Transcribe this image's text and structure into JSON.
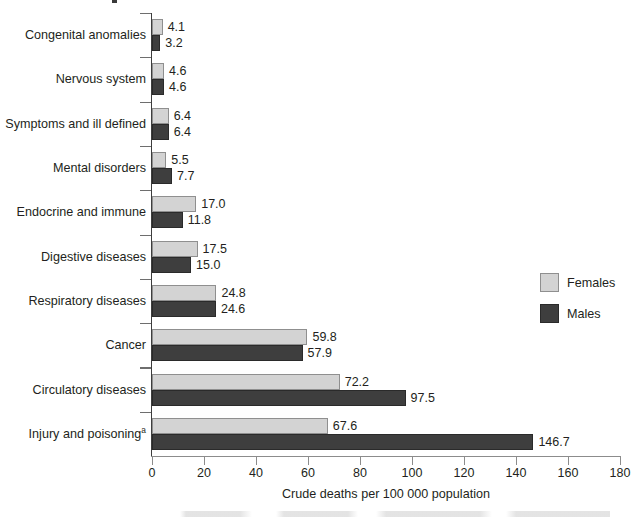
{
  "chart_data": {
    "type": "bar",
    "orientation": "horizontal",
    "title": "",
    "xlabel": "Crude deaths per 100 000 population",
    "ylabel": "",
    "xlim": [
      0,
      180
    ],
    "xticks": [
      0,
      20,
      40,
      60,
      80,
      100,
      120,
      140,
      160,
      180
    ],
    "grid": false,
    "legend_position": "right-middle",
    "categories": [
      "Congenital anomalies",
      "Nervous system",
      "Symptoms and ill defined",
      "Mental disorders",
      "Endocrine and immune",
      "Digestive diseases",
      "Respiratory diseases",
      "Cancer",
      "Circulatory diseases",
      "Injury and poisoning"
    ],
    "category_footnote_marks": [
      "",
      "",
      "",
      "",
      "",
      "",
      "",
      "",
      "",
      "a"
    ],
    "series": [
      {
        "name": "Females",
        "color": "#d3d3d3",
        "values": [
          4.1,
          4.6,
          6.4,
          5.5,
          17.0,
          17.5,
          24.8,
          59.8,
          72.2,
          67.6
        ],
        "labels": [
          "4.1",
          "4.6",
          "6.4",
          "5.5",
          "17.0",
          "17.5",
          "24.8",
          "59.8",
          "72.2",
          "67.6"
        ]
      },
      {
        "name": "Males",
        "color": "#3e3e3e",
        "values": [
          3.2,
          4.6,
          6.4,
          7.7,
          11.8,
          15.0,
          24.6,
          57.9,
          97.5,
          146.7
        ],
        "labels": [
          "3.2",
          "4.6",
          "6.4",
          "7.7",
          "11.8",
          "15.0",
          "24.6",
          "57.9",
          "97.5",
          "146.7"
        ]
      }
    ]
  },
  "legend": {
    "items": [
      {
        "label": "Females",
        "swatch": "females"
      },
      {
        "label": "Males",
        "swatch": "males"
      }
    ]
  },
  "axis": {
    "x_title": "Crude deaths per 100 000 population",
    "tick_labels": [
      "0",
      "20",
      "40",
      "60",
      "80",
      "100",
      "120",
      "140",
      "160",
      "180"
    ]
  },
  "colors": {
    "females": "#d3d3d3",
    "females_border": "#8f8f8f",
    "males": "#3e3e3e",
    "males_border": "#2a2a2a",
    "text": "#231f20",
    "axis": "#8c8c8c",
    "background": "#ffffff"
  }
}
